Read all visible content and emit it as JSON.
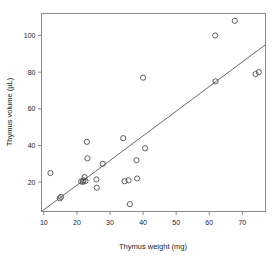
{
  "chart_data": {
    "type": "scatter",
    "title": "",
    "xlabel": "Thymus weight (mg)",
    "ylabel": "Thymus volume (µL)",
    "xlim": [
      9.3,
      77.0
    ],
    "ylim": [
      4.0,
      112.0
    ],
    "xticks": [
      10,
      20,
      30,
      40,
      50,
      60,
      70
    ],
    "yticks": [
      20,
      40,
      60,
      80,
      100
    ],
    "xtick_labels": [
      "10",
      "20",
      "30",
      "40",
      "50",
      "60",
      "70"
    ],
    "ytick_labels": [
      "20",
      "40",
      "60",
      "80",
      "100"
    ],
    "grid": false,
    "legend": null,
    "marker": "open-circle",
    "marker_color": "#4d4d4d",
    "frame_color": "#8c8c8c",
    "series": [
      {
        "name": "observations",
        "points": [
          [
            12.0,
            25.0
          ],
          [
            14.8,
            11.2
          ],
          [
            15.2,
            12.0
          ],
          [
            21.3,
            20.4
          ],
          [
            21.8,
            20.2
          ],
          [
            22.0,
            21.0
          ],
          [
            22.3,
            22.8
          ],
          [
            22.6,
            20.6
          ],
          [
            23.0,
            42.0
          ],
          [
            23.2,
            33.0
          ],
          [
            25.9,
            21.5
          ],
          [
            26.0,
            17.0
          ],
          [
            27.8,
            30.0
          ],
          [
            34.0,
            44.0
          ],
          [
            34.4,
            20.5
          ],
          [
            35.6,
            21.0
          ],
          [
            36.0,
            8.0
          ],
          [
            38.0,
            32.0
          ],
          [
            38.2,
            22.0
          ],
          [
            40.0,
            77.0
          ],
          [
            40.6,
            38.5
          ],
          [
            61.8,
            100.0
          ],
          [
            61.9,
            75.0
          ],
          [
            67.7,
            108.0
          ],
          [
            74.0,
            79.0
          ],
          [
            75.0,
            80.0
          ]
        ]
      }
    ],
    "fit_line": {
      "type": "linear-regression",
      "x_start": 9.3,
      "y_start": 4.0,
      "x_end": 77.0,
      "y_end": 95.0,
      "slope": 1.345,
      "intercept": -8.5
    }
  }
}
